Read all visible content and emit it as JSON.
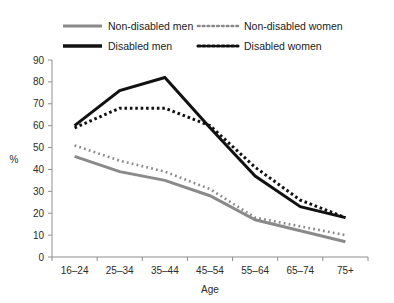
{
  "chart_data": {
    "type": "line",
    "title": "",
    "xlabel": "Age",
    "ylabel": "%",
    "categories": [
      "16–24",
      "25–34",
      "35–44",
      "45–54",
      "55–64",
      "65–74",
      "75+"
    ],
    "ylim": [
      0,
      90
    ],
    "yticks": [
      0,
      10,
      20,
      30,
      40,
      50,
      60,
      70,
      80,
      90
    ],
    "grid": false,
    "legend_position": "top",
    "series": [
      {
        "name": "Non-disabled men",
        "values": [
          46,
          39,
          35,
          28,
          17,
          12,
          7
        ],
        "color": "#8a8a8a",
        "style": "solid",
        "width": 3
      },
      {
        "name": "Non-disabled women",
        "values": [
          51,
          44,
          39,
          31,
          18,
          14,
          10
        ],
        "color": "#8a8a8a",
        "style": "dotted",
        "width": 2.6
      },
      {
        "name": "Disabled men",
        "values": [
          60,
          76,
          82,
          59,
          37,
          23,
          18
        ],
        "color": "#111111",
        "style": "solid",
        "width": 3
      },
      {
        "name": "Disabled women",
        "values": [
          59,
          68,
          68,
          60,
          41,
          26,
          18
        ],
        "color": "#111111",
        "style": "dotted",
        "width": 3
      }
    ]
  },
  "legend": {
    "items": [
      {
        "label": "Non-disabled men",
        "swatch": "solid-gray-line-swatch"
      },
      {
        "label": "Non-disabled women",
        "swatch": "dotted-gray-line-swatch"
      },
      {
        "label": "Disabled men",
        "swatch": "solid-black-line-swatch"
      },
      {
        "label": "Disabled women",
        "swatch": "dotted-black-line-swatch"
      }
    ]
  },
  "axes": {
    "y_title": "%",
    "x_title": "Age",
    "y_tick_labels": [
      "0",
      "10",
      "20",
      "30",
      "40",
      "50",
      "60",
      "70",
      "80",
      "90"
    ],
    "x_tick_labels": [
      "16–24",
      "25–34",
      "35–44",
      "45–54",
      "55–64",
      "65–74",
      "75+"
    ]
  }
}
